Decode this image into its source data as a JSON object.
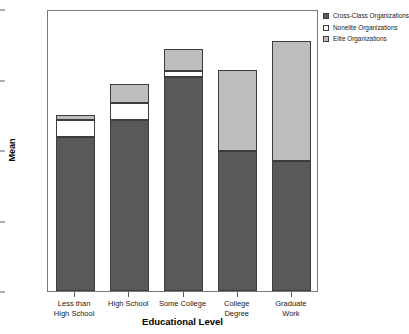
{
  "chart_data": {
    "type": "bar",
    "subtype": "stacked-bar",
    "title": "",
    "xlabel": "Educational Level",
    "ylabel": "Mean",
    "ylim": [
      0.0,
      2.0
    ],
    "yticks": [
      "0.00",
      "0.50",
      "1.00",
      "1.50",
      "2.00"
    ],
    "ytick_values": [
      0.0,
      0.5,
      1.0,
      1.5,
      2.0
    ],
    "grid": false,
    "legend_position": "right",
    "categories": [
      "Less than\nHigh School",
      "High School",
      "Some College",
      "College\nDegree",
      "Graduate\nWork"
    ],
    "series": [
      {
        "name": "Cross-Class Organizations",
        "color": "#595959",
        "values": [
          1.09,
          1.21,
          1.52,
          0.99,
          0.92
        ]
      },
      {
        "name": "Nonelite Organizations",
        "color": "#ffffff",
        "values": [
          0.12,
          0.12,
          0.04,
          0.0,
          0.0
        ]
      },
      {
        "name": "Elite Organizations",
        "color": "#bdbdbd",
        "values": [
          0.04,
          0.14,
          0.16,
          0.58,
          0.85
        ]
      }
    ],
    "totals": [
      1.25,
      1.47,
      1.72,
      1.57,
      1.77
    ]
  },
  "legend": {
    "items": [
      {
        "label": "Cross-Class Organizations",
        "swatch": "filled-dark"
      },
      {
        "label": "Nonelite Organizations",
        "swatch": "empty-white"
      },
      {
        "label": "Elite Organizations",
        "swatch": "filled-light"
      }
    ]
  },
  "axes": {
    "y_title": "Mean",
    "x_title": "Educational Level"
  }
}
